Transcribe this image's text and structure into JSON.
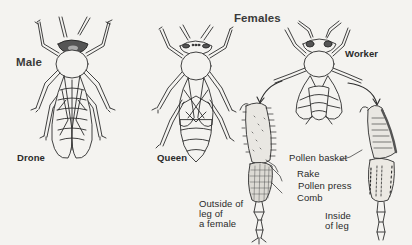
{
  "diagram": {
    "type": "labeled-illustration",
    "group_labels": {
      "male": "Male",
      "females": "Females"
    },
    "bees": [
      {
        "id": "drone",
        "label": "Drone",
        "sex": "Male"
      },
      {
        "id": "queen",
        "label": "Queen",
        "sex": "Female"
      },
      {
        "id": "worker",
        "label": "Worker",
        "sex": "Female"
      }
    ],
    "leg_views": {
      "outside": "Outside of\nleg of\na female",
      "inside": "Inside\nof leg"
    },
    "leg_parts": [
      {
        "id": "pollen-basket",
        "label": "Pollen basket"
      },
      {
        "id": "rake",
        "label": "Rake"
      },
      {
        "id": "pollen-press",
        "label": "Pollen press"
      },
      {
        "id": "comb",
        "label": "Comb"
      }
    ],
    "colors": {
      "background": "#f4f3f0",
      "ink": "#2a2a2a"
    }
  }
}
